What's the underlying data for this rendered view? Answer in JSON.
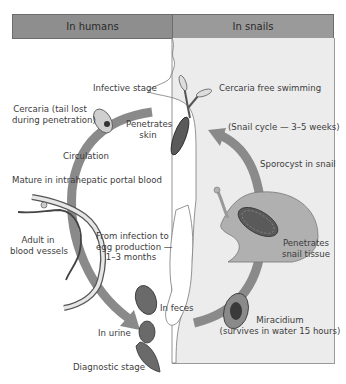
{
  "headers": {
    "left": "In humans",
    "right": "In snails"
  },
  "labels": {
    "infective_stage": "Infective stage",
    "cercaria_free": "Cercaria free swimming",
    "cercaria_tail_line1": "Cercaria (tail lost",
    "cercaria_tail_line2": "during penetration)",
    "penetrates_skin_line1": "Penetrates",
    "penetrates_skin_line2": "skin",
    "snail_cycle": "(Snail cycle — 3–5 weeks)",
    "circulation": "Circulation",
    "sporocyst": "Sporocyst in snail",
    "mature": "Mature in intrahepatic portal blood",
    "adult_line1": "Adult in",
    "adult_line2": "blood vessels",
    "infection_line1": "From infection to",
    "infection_line2": "egg production —",
    "infection_line3": "1–3 months",
    "penetrates_snail_line1": "Penetrates",
    "penetrates_snail_line2": "snail tissue",
    "in_feces": "In feces",
    "in_urine": "In urine",
    "miracidium_line1": "Miracidium",
    "miracidium_line2": "(survives in water 15 hours)",
    "diagnostic_stage": "Diagnostic stage"
  },
  "colors": {
    "header_left": "#8e8e8e",
    "header_right": "#9a9a9a",
    "snail_panel": "#ececec",
    "arrow": "#8a8a8a",
    "organism_dark": "#4a4a4a"
  }
}
